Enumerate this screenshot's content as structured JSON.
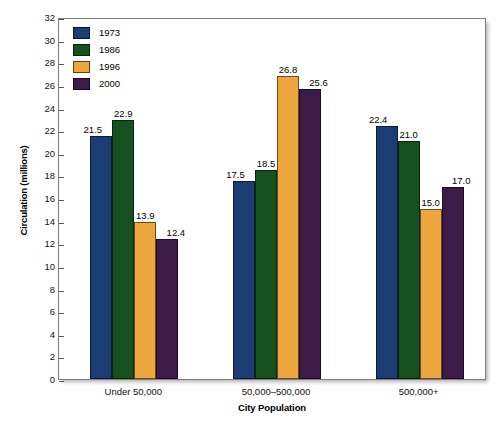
{
  "chart_data": {
    "type": "bar",
    "title": "",
    "xlabel": "City Population",
    "ylabel": "Circulation (millions)",
    "categories": [
      "Under 50,000",
      "50,000–500,000",
      "500,000+"
    ],
    "series": [
      {
        "name": "1973",
        "color": "#1b3d73",
        "values": [
          21.5,
          17.5,
          22.4
        ]
      },
      {
        "name": "1986",
        "color": "#14511e",
        "values": [
          22.9,
          18.5,
          21.0
        ]
      },
      {
        "name": "1996",
        "color": "#eda63e",
        "values": [
          13.9,
          26.8,
          15.0
        ]
      },
      {
        "name": "2000",
        "color": "#3d1a48",
        "values": [
          12.4,
          25.6,
          17.0
        ]
      }
    ],
    "value_labels": [
      [
        "21.5",
        "22.9",
        "13.9",
        "12.4"
      ],
      [
        "17.5",
        "18.5",
        "26.8",
        "25.6"
      ],
      [
        "22.4",
        "21.0",
        "15.0",
        "17.0"
      ]
    ],
    "ylim": [
      0,
      32
    ],
    "ytick_values": [
      0,
      2,
      4,
      6,
      8,
      10,
      12,
      14,
      16,
      18,
      20,
      22,
      24,
      26,
      28,
      30,
      32
    ],
    "ytick_labels": [
      "0",
      "2",
      "4",
      "6",
      "8",
      "10",
      "12",
      "14",
      "16",
      "18",
      "20",
      "22",
      "24",
      "26",
      "28",
      "30",
      "32"
    ],
    "grid": false,
    "legend_position": "top-left"
  },
  "legend": {
    "entries": [
      {
        "label": "1973"
      },
      {
        "label": "1986"
      },
      {
        "label": "1996"
      },
      {
        "label": "2000"
      }
    ]
  }
}
